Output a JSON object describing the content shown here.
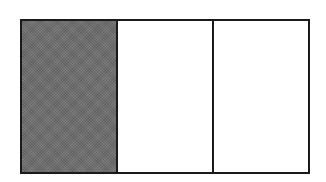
{
  "diagram": {
    "type": "fraction-bar",
    "total_parts": 3,
    "shaded_parts": 1,
    "parts": [
      {
        "index": 0,
        "shaded": true
      },
      {
        "index": 1,
        "shaded": false
      },
      {
        "index": 2,
        "shaded": false
      }
    ],
    "colors": {
      "outline": "#1a1a1a",
      "shaded_fill": "#6e6e6e",
      "unshaded_fill": "#ffffff"
    }
  }
}
